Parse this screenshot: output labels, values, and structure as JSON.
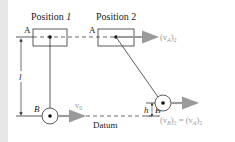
{
  "diagram": {
    "positions": [
      {
        "label": "Position ",
        "index": "1"
      },
      {
        "label": "Position ",
        "index": "2"
      }
    ],
    "points": {
      "A": "A",
      "B": "B"
    },
    "dimensions": {
      "length": "l",
      "height": "h"
    },
    "datum_label": "Datum",
    "velocities": {
      "v0": {
        "base": "v",
        "sub": "0"
      },
      "vA2": {
        "open": "(v",
        "sub": "A",
        "close": ")",
        "outer_sub": "2"
      },
      "vB2_eq": {
        "text": "(v",
        "sub_B": "B",
        "mid": ")",
        "sub2": "2",
        "eq": " = (v",
        "sub_A": "A",
        "end": ")",
        "sub2b": "2"
      }
    },
    "colors": {
      "line": "#333333",
      "arrow": "#9a9a9a",
      "strip": "#e6e6e6",
      "dash": "#444444"
    }
  }
}
